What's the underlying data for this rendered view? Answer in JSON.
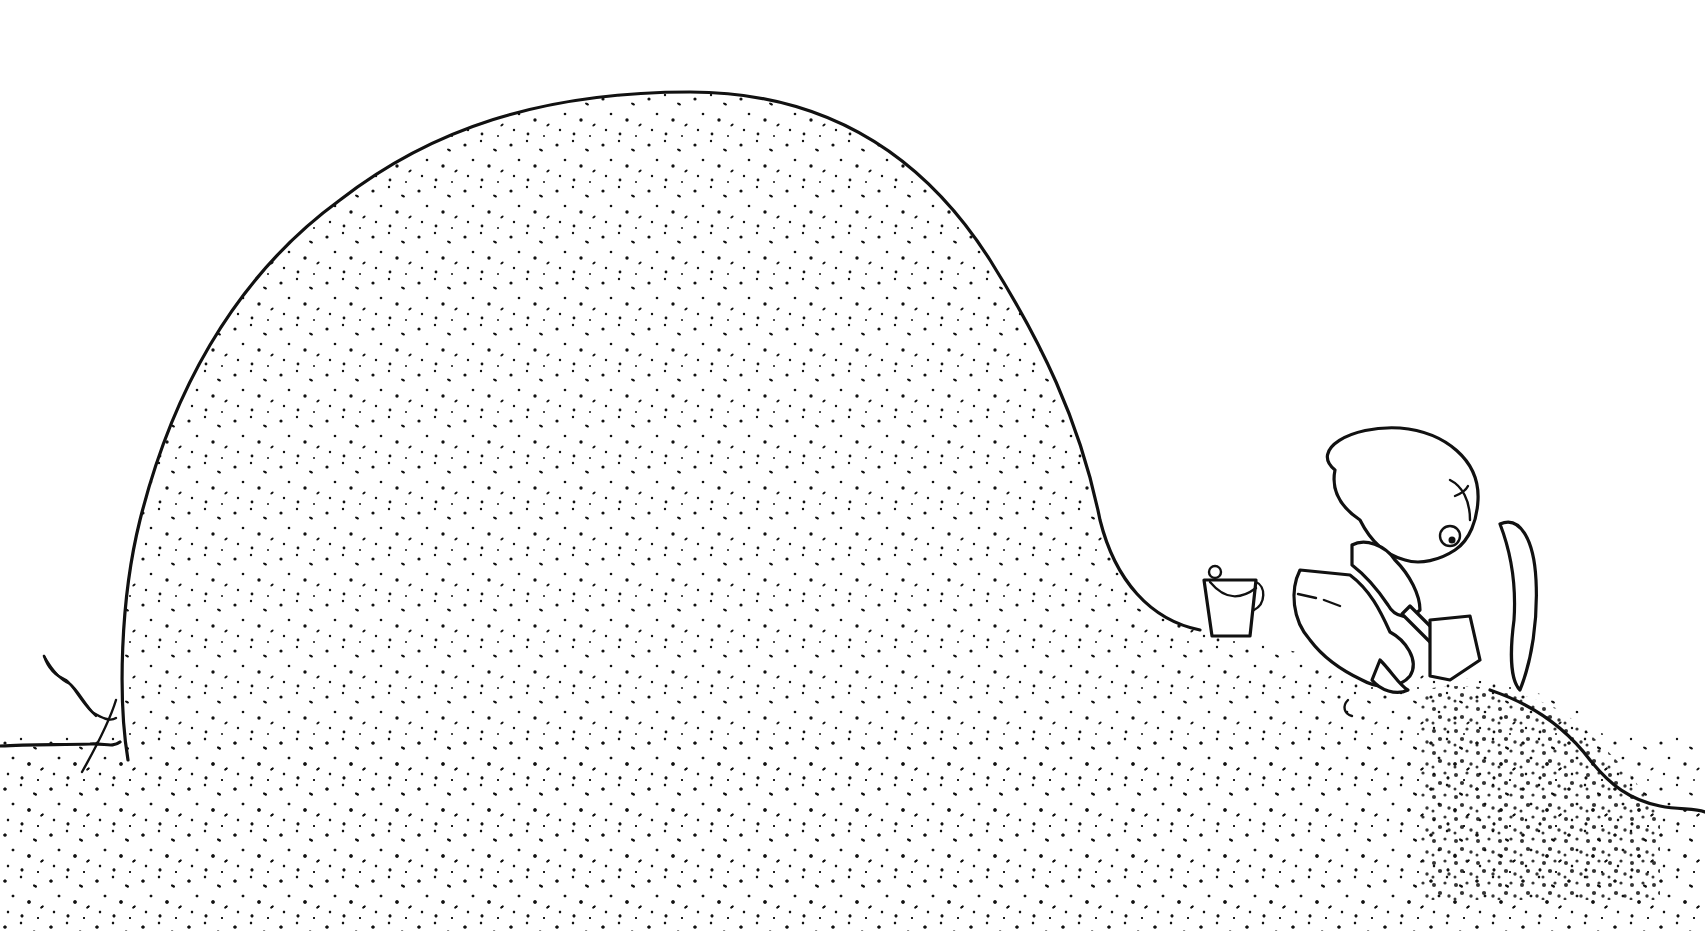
{
  "illustration": {
    "title": "Child digging at the base of a giant sand mound",
    "style": "black ink line drawing with stippled sand",
    "colors": {
      "ink": "#111111",
      "paper": "#ffffff"
    },
    "elements": {
      "mound": "large stippled sand mound",
      "child": "kneeling child with shovel",
      "bucket": "small sand pail",
      "shovel": "hand shovel",
      "sprout": "small plant/root on left edge",
      "sand_spray": "dense stippled dirt being dug"
    }
  }
}
